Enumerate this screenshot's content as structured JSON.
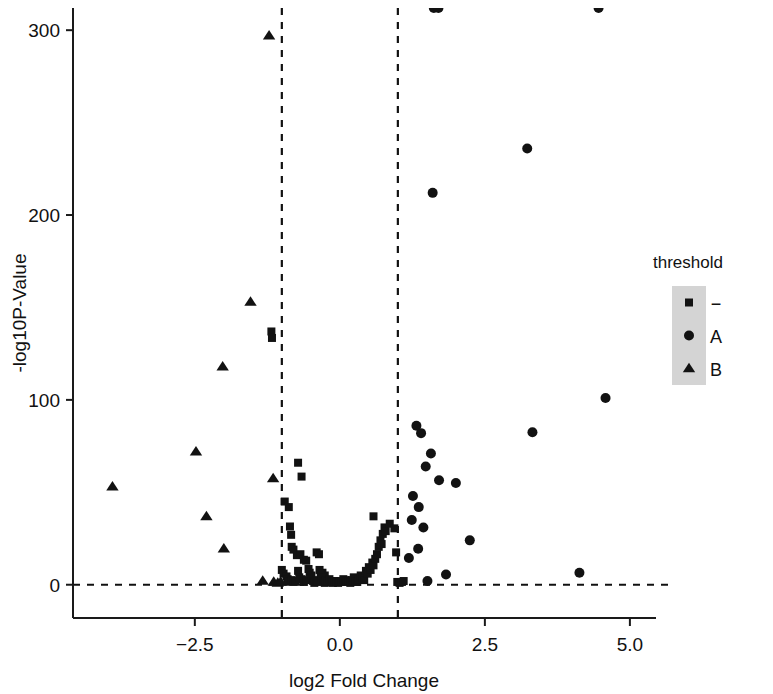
{
  "chart_data": {
    "type": "scatter",
    "title": "",
    "xlabel": "log2 Fold Change",
    "ylabel": "-log10P-Value",
    "xlim": [
      -4.6,
      5.45
    ],
    "ylim": [
      -18,
      312
    ],
    "xticks": [
      -2.5,
      0.0,
      2.5,
      5.0
    ],
    "xticklabels": [
      "−2.5",
      "0.0",
      "2.5",
      "5.0"
    ],
    "yticks": [
      0,
      100,
      200,
      300
    ],
    "yticklabels": [
      "0",
      "100",
      "200",
      "300"
    ],
    "grid": false,
    "legend": {
      "title": "threshold",
      "position": "right",
      "entries": [
        {
          "label": "−",
          "marker": "square"
        },
        {
          "label": "A",
          "marker": "circle"
        },
        {
          "label": "B",
          "marker": "triangle"
        }
      ]
    },
    "annotations": {
      "hline_y": 0,
      "vline_x_left": -1.0,
      "vline_x_right": 1.0,
      "hline_style": "dashed",
      "vline_style": "dashed"
    },
    "series": [
      {
        "name": "−",
        "marker": "square",
        "points": [
          [
            -1.18,
            137.0
          ],
          [
            -1.17,
            133.5
          ],
          [
            -0.72,
            66.0
          ],
          [
            -0.66,
            58.5
          ],
          [
            -0.95,
            45.0
          ],
          [
            -0.88,
            42.0
          ],
          [
            -0.86,
            31.5
          ],
          [
            -0.84,
            27.0
          ],
          [
            -0.83,
            20.5
          ],
          [
            -0.8,
            19.0
          ],
          [
            -0.74,
            16.0
          ],
          [
            -0.68,
            16.5
          ],
          [
            -0.62,
            13.5
          ],
          [
            -0.58,
            13.0
          ],
          [
            -0.4,
            17.5
          ],
          [
            -0.36,
            16.5
          ],
          [
            -0.3,
            6.5
          ],
          [
            -0.26,
            5.0
          ],
          [
            -1.0,
            8.0
          ],
          [
            -0.97,
            6.0
          ],
          [
            -0.92,
            4.5
          ],
          [
            -0.9,
            3.0
          ],
          [
            -0.88,
            2.0
          ],
          [
            -0.84,
            2.5
          ],
          [
            -0.8,
            1.5
          ],
          [
            -0.76,
            2.0
          ],
          [
            -0.72,
            7.5
          ],
          [
            -0.7,
            4.0
          ],
          [
            -0.66,
            3.0
          ],
          [
            -0.62,
            1.5
          ],
          [
            -0.58,
            2.5
          ],
          [
            -0.54,
            8.5
          ],
          [
            -0.52,
            6.5
          ],
          [
            -0.49,
            5.0
          ],
          [
            -0.46,
            2.0
          ],
          [
            -0.44,
            1.0
          ],
          [
            -0.41,
            2.5
          ],
          [
            -0.38,
            1.5
          ],
          [
            -0.35,
            8.0
          ],
          [
            -0.33,
            6.0
          ],
          [
            -0.31,
            4.0
          ],
          [
            -0.29,
            2.0
          ],
          [
            -0.26,
            1.0
          ],
          [
            -0.24,
            2.5
          ],
          [
            -0.21,
            1.5
          ],
          [
            -0.18,
            3.0
          ],
          [
            -0.15,
            2.0
          ],
          [
            -0.12,
            1.0
          ],
          [
            -0.09,
            2.0
          ],
          [
            -0.06,
            1.5
          ],
          [
            -0.03,
            1.0
          ],
          [
            0.0,
            2.0
          ],
          [
            0.03,
            1.5
          ],
          [
            0.06,
            3.0
          ],
          [
            0.09,
            2.5
          ],
          [
            0.12,
            1.5
          ],
          [
            0.15,
            2.0
          ],
          [
            0.18,
            1.0
          ],
          [
            0.21,
            2.5
          ],
          [
            0.24,
            4.0
          ],
          [
            0.27,
            2.0
          ],
          [
            0.3,
            1.5
          ],
          [
            0.33,
            3.0
          ],
          [
            0.36,
            5.0
          ],
          [
            0.39,
            4.0
          ],
          [
            0.42,
            2.5
          ],
          [
            0.45,
            7.5
          ],
          [
            0.48,
            6.0
          ],
          [
            0.5,
            9.5
          ],
          [
            0.53,
            8.0
          ],
          [
            0.56,
            12.0
          ],
          [
            0.58,
            10.5
          ],
          [
            0.61,
            14.0
          ],
          [
            0.64,
            16.5
          ],
          [
            0.67,
            20.5
          ],
          [
            0.7,
            24.0
          ],
          [
            0.72,
            22.0
          ],
          [
            0.74,
            27.5
          ],
          [
            0.77,
            31.0
          ],
          [
            0.79,
            29.0
          ],
          [
            0.58,
            37.0
          ],
          [
            0.86,
            33.0
          ],
          [
            0.94,
            30.5
          ],
          [
            0.97,
            17.5
          ],
          [
            0.99,
            1.5
          ],
          [
            1.03,
            1.0
          ],
          [
            1.07,
            1.5
          ],
          [
            1.1,
            2.0
          ]
        ]
      },
      {
        "name": "A",
        "marker": "circle",
        "points": [
          [
            1.62,
            312.0
          ],
          [
            1.7,
            312.0
          ],
          [
            4.46,
            312.0
          ],
          [
            3.23,
            236.0
          ],
          [
            1.6,
            212.0
          ],
          [
            4.58,
            101.0
          ],
          [
            3.32,
            82.5
          ],
          [
            1.32,
            86.0
          ],
          [
            1.4,
            82.0
          ],
          [
            1.57,
            71.0
          ],
          [
            1.48,
            64.0
          ],
          [
            2.0,
            55.0
          ],
          [
            1.71,
            56.5
          ],
          [
            1.26,
            48.0
          ],
          [
            1.36,
            42.0
          ],
          [
            1.24,
            35.0
          ],
          [
            1.44,
            31.0
          ],
          [
            2.24,
            24.0
          ],
          [
            1.35,
            19.5
          ],
          [
            1.19,
            14.5
          ],
          [
            1.83,
            5.5
          ],
          [
            4.13,
            6.5
          ],
          [
            1.51,
            2.0
          ]
        ]
      },
      {
        "name": "B",
        "marker": "triangle",
        "points": [
          [
            -1.22,
            297.0
          ],
          [
            -1.54,
            153.0
          ],
          [
            -2.02,
            118.0
          ],
          [
            -2.48,
            72.0
          ],
          [
            -3.92,
            53.0
          ],
          [
            -1.15,
            57.5
          ],
          [
            -2.3,
            37.0
          ],
          [
            -2.0,
            19.5
          ],
          [
            -1.33,
            2.0
          ],
          [
            -1.14,
            1.5
          ],
          [
            -1.07,
            1.0
          ],
          [
            -1.02,
            1.5
          ]
        ]
      }
    ]
  }
}
